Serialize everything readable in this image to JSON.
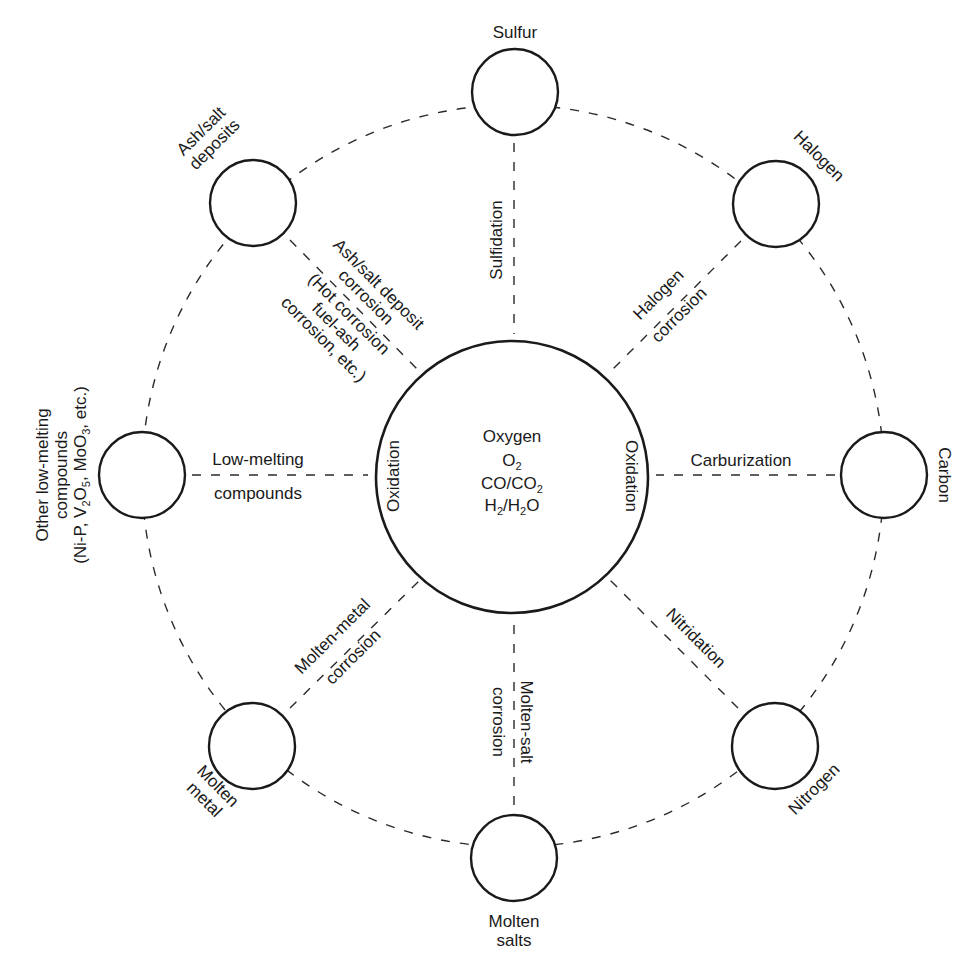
{
  "diagram": {
    "center": {
      "title": "Oxygen",
      "lines": [
        {
          "main": "O",
          "sub": "2",
          "after": ""
        },
        {
          "main": "CO/CO",
          "sub": "2",
          "after": ""
        },
        {
          "main": "H",
          "sub": "2",
          "after": "/H",
          "sub2": "2",
          "tail": "O"
        }
      ],
      "left_label": "Oxidation",
      "right_label": "Oxidation"
    },
    "nodes": [
      {
        "id": "sulfur",
        "label": "Sulfur"
      },
      {
        "id": "halogen",
        "label": "Halogen"
      },
      {
        "id": "carbon",
        "label": "Carbon"
      },
      {
        "id": "nitrogen",
        "label": "Nitrogen"
      },
      {
        "id": "molten-salts",
        "label_lines": [
          "Molten",
          "salts"
        ]
      },
      {
        "id": "molten-metal",
        "label_lines": [
          "Molten",
          "metal"
        ]
      },
      {
        "id": "other-low-melting",
        "label_lines": [
          "Other low-melting",
          "compounds"
        ],
        "formula": {
          "a": "(Ni-P, V",
          "s1": "2",
          "b": "O",
          "s2": "5",
          "c": ", MoO",
          "s3": "3",
          "d": ", etc.)"
        }
      },
      {
        "id": "ash-salt",
        "label_lines": [
          "Ash/salt",
          "deposits"
        ]
      }
    ],
    "processes": {
      "sulfidation": "Sulfidation",
      "halogen_corrosion": [
        "Halogen",
        "corrosion"
      ],
      "carburization": "Carburization",
      "nitridation": "Nitridation",
      "molten_salt_corrosion": [
        "Molten-salt",
        "corrosion"
      ],
      "molten_metal_corrosion": [
        "Molten-metal",
        "corrosion"
      ],
      "low_melting_compounds": [
        "Low-melting",
        "compounds"
      ],
      "ash_salt_corrosion": [
        "Ash/salt deposit",
        "corrosion",
        "(Hot corrosion",
        "fuel-ash",
        "corrosion, etc.)"
      ]
    }
  }
}
